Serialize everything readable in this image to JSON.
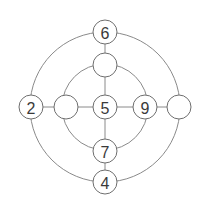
{
  "diagram": {
    "title": "",
    "center": {
      "x": 105,
      "y": 107
    },
    "rings": {
      "outer_radius": 75,
      "inner_radius": 41
    },
    "nodes": [
      {
        "id": "outer-top",
        "label": "6",
        "x": 105,
        "y": 32
      },
      {
        "id": "inner-top",
        "label": "",
        "x": 105,
        "y": 65
      },
      {
        "id": "outer-left",
        "label": "2",
        "x": 31,
        "y": 107
      },
      {
        "id": "inner-left",
        "label": "",
        "x": 66,
        "y": 107
      },
      {
        "id": "center",
        "label": "5",
        "x": 105,
        "y": 107
      },
      {
        "id": "inner-right",
        "label": "9",
        "x": 145,
        "y": 107
      },
      {
        "id": "outer-right",
        "label": "",
        "x": 179,
        "y": 107
      },
      {
        "id": "inner-bottom",
        "label": "7",
        "x": 105,
        "y": 151
      },
      {
        "id": "outer-bottom",
        "label": "4",
        "x": 105,
        "y": 182
      }
    ],
    "node_radius": 12
  }
}
